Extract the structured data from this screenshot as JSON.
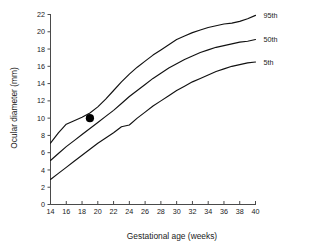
{
  "chart_data": {
    "type": "line",
    "title": "",
    "xlabel": "Gestational age (weeks)",
    "ylabel": "Ocular diameter (mm)",
    "xlim": [
      14,
      40
    ],
    "ylim": [
      0,
      22
    ],
    "xticks": [
      14,
      16,
      18,
      20,
      22,
      24,
      26,
      28,
      30,
      32,
      34,
      36,
      38,
      40
    ],
    "yticks": [
      0,
      2,
      4,
      6,
      8,
      10,
      12,
      14,
      16,
      18,
      20,
      22
    ],
    "grid": false,
    "legend_position": "right-inline-labels",
    "x": [
      14,
      15,
      16,
      17,
      18,
      19,
      20,
      21,
      22,
      23,
      24,
      25,
      26,
      27,
      28,
      29,
      30,
      31,
      32,
      33,
      34,
      35,
      36,
      37,
      38,
      39,
      40
    ],
    "series": [
      {
        "name": "95th",
        "label": "95th",
        "color": "#111111",
        "values": [
          7.1,
          8.3,
          9.3,
          9.7,
          10.1,
          10.6,
          11.3,
          12.2,
          13.2,
          14.2,
          15.1,
          15.9,
          16.6,
          17.3,
          17.9,
          18.5,
          19.1,
          19.5,
          19.9,
          20.2,
          20.5,
          20.7,
          20.9,
          21.0,
          21.2,
          21.5,
          21.9
        ]
      },
      {
        "name": "50th",
        "label": "50th",
        "color": "#111111",
        "values": [
          5.1,
          5.9,
          6.7,
          7.4,
          8.1,
          8.8,
          9.5,
          10.2,
          10.9,
          11.7,
          12.5,
          13.2,
          13.9,
          14.6,
          15.2,
          15.8,
          16.3,
          16.8,
          17.2,
          17.6,
          17.9,
          18.2,
          18.4,
          18.6,
          18.8,
          18.9,
          19.1
        ]
      },
      {
        "name": "5th",
        "label": "5th",
        "color": "#111111",
        "values": [
          2.9,
          3.6,
          4.3,
          5.0,
          5.7,
          6.4,
          7.1,
          7.7,
          8.3,
          9.0,
          9.2,
          10.0,
          10.7,
          11.4,
          12.0,
          12.6,
          13.2,
          13.7,
          14.2,
          14.6,
          15.0,
          15.4,
          15.7,
          16.0,
          16.2,
          16.4,
          16.5
        ]
      }
    ],
    "annotations": [
      {
        "name": "measurement-point",
        "type": "point-marker",
        "x": 19,
        "y": 10,
        "color": "#000000"
      }
    ]
  }
}
